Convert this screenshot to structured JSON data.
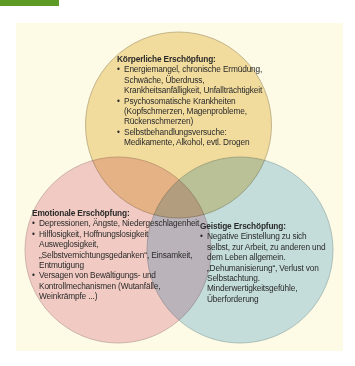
{
  "diagram": {
    "type": "venn",
    "colors": {
      "header_bar": "#5e9a26",
      "panel_background": "#fdfbe6",
      "physical_circle": "#f3dfae",
      "emotional_circle": "#f3cfd8",
      "mental_circle": "#c6e1f3",
      "circle_stroke": "#b8a98a"
    },
    "circles": [
      {
        "id": "physical",
        "title": "Körperliche Erschöpfung:",
        "items": [
          "Energiemangel, chronische Ermüdung, Schwäche, Überdruss, Krankheitsanfälligkeit, Unfallträchtigkeit",
          "Psychosomatische Krankheiten (Kopfschmerzen, Magenprobleme, Rückenschmerzen)",
          "Selbstbehandlungsversuche: Medikamente, Alkohol, evtl. Drogen"
        ]
      },
      {
        "id": "emotional",
        "title": "Emotionale Erschöpfung:",
        "items": [
          "Depressionen, Ängste, Niedergeschlagenheit",
          "Hilflosigkeit, Hoffnungslosigkeit Ausweglosigkeit, „Selbstvernichtungsgedanken“, Einsamkeit, Entmutigung",
          "Versagen von Bewältigungs- und Kontrollmechanismen (Wutanfälle, Weinkrämpfe ...)"
        ]
      },
      {
        "id": "mental",
        "title": "Geistige Erschöpfung:",
        "items": [
          "Negative Einstellung zu sich selbst, zur Arbeit, zu anderen und dem Leben allgemein. „Dehumanisierung“, Verlust von Selbstachtung. Minderwertigkeitsgefühle, Überforderung"
        ]
      }
    ]
  }
}
